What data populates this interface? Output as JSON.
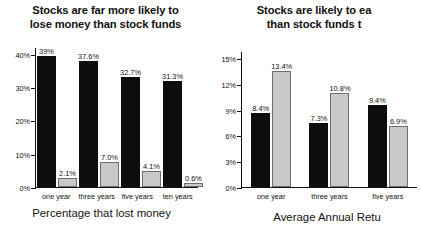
{
  "chart_data": [
    {
      "type": "bar",
      "title": "Stocks are far more likely to\nlose money than stock funds",
      "caption": "Percentage that lost money",
      "xlabel": "",
      "ylabel": "",
      "categories": [
        "one year",
        "three years",
        "five years",
        "ten years"
      ],
      "ylim": [
        0,
        42
      ],
      "yticks": [
        0,
        10,
        20,
        30,
        40
      ],
      "ytick_labels": [
        "0%",
        "10%",
        "20%",
        "30%",
        "40%"
      ],
      "grid": false,
      "legend": "none",
      "series": [
        {
          "name": "Stocks",
          "color": "#0d0d0d",
          "values": [
            39,
            37.6,
            32.7,
            31.3
          ],
          "labels": [
            "39%",
            "37.6%",
            "32.7%",
            "31.3%"
          ]
        },
        {
          "name": "Stock funds",
          "color": "#c9c9c9",
          "values": [
            2.1,
            7.0,
            4.1,
            0.6
          ],
          "labels": [
            "2.1%",
            "7.0%",
            "4.1%",
            "0.6%"
          ]
        }
      ]
    },
    {
      "type": "bar",
      "title": "Stocks are likely to ea\nthan stock funds t",
      "caption": "Average Annual Retu",
      "xlabel": "",
      "ylabel": "",
      "categories": [
        "one year",
        "three years",
        "five years"
      ],
      "ylim": [
        0,
        15.8
      ],
      "yticks": [
        0,
        3,
        6,
        9,
        12,
        15
      ],
      "ytick_labels": [
        "0%",
        "3%",
        "6%",
        "9%",
        "12%",
        "15%"
      ],
      "grid": false,
      "legend": "none",
      "series": [
        {
          "name": "Stocks",
          "color": "#0d0d0d",
          "values": [
            8.4,
            7.3,
            9.4
          ],
          "labels": [
            "8.4%",
            "7.3%",
            "9.4%"
          ]
        },
        {
          "name": "Stock funds",
          "color": "#c9c9c9",
          "values": [
            13.4,
            10.8,
            6.9
          ],
          "labels": [
            "13.4%",
            "10.8%",
            "6.9%"
          ]
        }
      ]
    }
  ]
}
